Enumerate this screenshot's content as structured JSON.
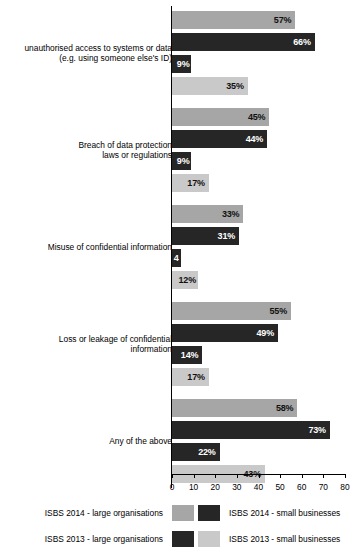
{
  "chart_data": {
    "type": "bar",
    "orientation": "horizontal",
    "title": "",
    "xlabel": "",
    "ylabel": "",
    "xlim": [
      0,
      80
    ],
    "grid": false,
    "legend_position": "bottom",
    "xticks": [
      "0",
      "10",
      "20",
      "30",
      "40",
      "50",
      "60",
      "70",
      "80"
    ],
    "categories": [
      "unauthorised access to systems or data\n(e.g. using someone else's ID)",
      "Breach of data protection\nlaws or regulations",
      "Misuse of confidential information",
      "Loss or leakage of confidential\ninformation",
      "Any of the above"
    ],
    "series": [
      {
        "name": "ISBS 2014 - large organisations",
        "color": "#a6a6a6",
        "values": [
          57,
          45,
          33,
          55,
          58
        ],
        "labels": [
          "57%",
          "45%",
          "33%",
          "55%",
          "58%"
        ]
      },
      {
        "name": "ISBS 2014 - small businesses",
        "color": "#262626",
        "values": [
          66,
          44,
          31,
          49,
          73
        ],
        "labels": [
          "66%",
          "44%",
          "31%",
          "49%",
          "73%"
        ]
      },
      {
        "name": "ISBS 2013 - large organisations",
        "color": "#262626",
        "values": [
          9,
          9,
          4,
          14,
          22
        ],
        "labels": [
          "9%",
          "9%",
          "4",
          "14%",
          "22%"
        ]
      },
      {
        "name": "ISBS 2013 - small businesses",
        "color": "#c9c9c9",
        "values": [
          35,
          17,
          12,
          17,
          43
        ],
        "labels": [
          "35%",
          "17%",
          "12%",
          "17%",
          "43%"
        ]
      }
    ]
  },
  "legend": {
    "rows": [
      {
        "left_label": "ISBS 2014 - large organisations",
        "left_color": "#a6a6a6",
        "right_color": "#262626",
        "right_label": "ISBS 2014 - small businesses"
      },
      {
        "left_label": "ISBS 2013 - large organisations",
        "left_color": "#262626",
        "right_color": "#c9c9c9",
        "right_label": "ISBS 2013 - small businesses"
      }
    ]
  }
}
